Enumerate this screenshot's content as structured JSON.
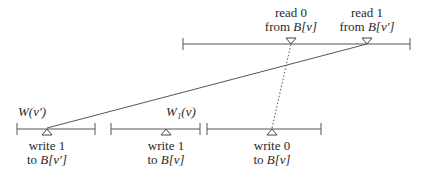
{
  "diagram": {
    "top_process": {
      "events": [
        {
          "line1": "read 0",
          "line2_prefix": "from ",
          "line2_math": "B[v]",
          "x": 291
        },
        {
          "line1": "read 1",
          "line2_prefix": "from ",
          "line2_math": "B[v′]",
          "x": 367
        }
      ]
    },
    "bottom_intervals": [
      {
        "label": "W(v′)",
        "event": {
          "line1": "write 1",
          "line2_prefix": "to ",
          "line2_math": "B[v′]",
          "x": 47
        }
      },
      {
        "label": "W₁(v)",
        "event": {
          "line1": "write 1",
          "line2_prefix": "to ",
          "line2_math": "B[v]",
          "x": 166
        }
      },
      {
        "label": "",
        "event": {
          "line1": "write 0",
          "line2_prefix": "to ",
          "line2_math": "B[v]",
          "x": 272
        }
      }
    ],
    "arrows": [
      {
        "from": "write 1 to B[v′]",
        "to": "read 1 from B[v′]",
        "style": "solid"
      },
      {
        "from": "write 0 to B[v]",
        "to": "read 0 from B[v]",
        "style": "dotted"
      }
    ],
    "colors": {
      "line": "#555555",
      "text": "#2a2a2a"
    }
  }
}
